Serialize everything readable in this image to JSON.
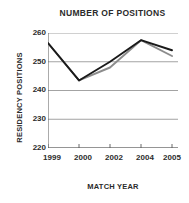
{
  "chart_data": {
    "type": "line",
    "title": "NUMBER OF POSITIONS",
    "xlabel": "MATCH YEAR",
    "ylabel": "RESIDENCY POSITIONS",
    "x": [
      1999,
      2000,
      2002,
      2004,
      2005
    ],
    "categories": [
      "1999",
      "2000",
      "2002",
      "2004",
      "2005"
    ],
    "xtick_labels": [
      "1999",
      "2000",
      "2002",
      "2004",
      "2005"
    ],
    "ytick_labels": [
      "220",
      "230",
      "240",
      "250",
      "260"
    ],
    "ylim": [
      220,
      260
    ],
    "yticks": [
      220,
      230,
      240,
      250,
      260
    ],
    "grid": true,
    "legend": "none",
    "series": [
      {
        "name": "series-dark",
        "color": "#1a1a1a",
        "values": [
          256.5,
          243.5,
          250.0,
          257.5,
          254.0
        ]
      },
      {
        "name": "series-gray",
        "color": "#8c8c8c",
        "values": [
          256.5,
          243.5,
          248.0,
          257.5,
          252.0
        ]
      }
    ]
  },
  "axis": {
    "line_color": "#595959",
    "grid_color": "#8c8c8c",
    "text_color": "#2b2b2b"
  }
}
